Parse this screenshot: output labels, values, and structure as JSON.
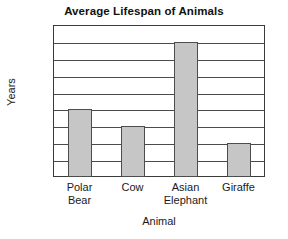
{
  "chart_data": {
    "type": "bar",
    "title": "Average Lifespan of Animals",
    "xlabel": "Animal",
    "ylabel": "Years",
    "categories": [
      "Polar Bear",
      "Cow",
      "Asian Elephant",
      "Giraffe"
    ],
    "category_lines": [
      [
        "Polar",
        "Bear"
      ],
      [
        "Cow"
      ],
      [
        "Asian",
        "Elephant"
      ],
      [
        "Giraffe"
      ]
    ],
    "values": [
      20,
      15,
      40,
      10
    ],
    "ylim": [
      0,
      45
    ],
    "ytick_step": 5,
    "yticks": [
      0,
      5,
      10,
      15,
      20,
      25,
      30,
      35,
      40,
      45
    ],
    "ytick_labels": [
      "0",
      "5",
      "10",
      "15",
      "20",
      "25",
      "30",
      "35",
      "40",
      "45"
    ],
    "grid": true,
    "grid_axis": "y",
    "legend": "none",
    "bar_color": "#c6c6c6",
    "bar_border_color": "#4d4d4d",
    "axis_color": "#3a3a3a",
    "grid_color": "#4a4a4a",
    "background_color": "#ffffff",
    "text_color": "#1a1a1a"
  }
}
